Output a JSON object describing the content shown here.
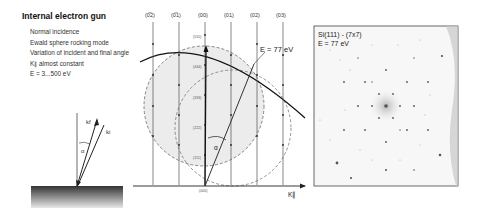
{
  "left_panel": {
    "title": "Internal electron gun",
    "bullets": [
      "Normal incidence",
      "Ewald sphere rocking mode",
      "Variation of incident and final angle",
      "K∥ almost constant",
      "E = 3...500 eV"
    ],
    "schematic": {
      "kf_label": "kf",
      "ki_label": "ki",
      "angle_label": "α"
    }
  },
  "ewald_diagram": {
    "rod_labels": [
      "(0̅2)",
      "(0̅1)",
      "(00)",
      "(01)",
      "(02)",
      "(03)"
    ],
    "spot_labels": [
      "(555)",
      "(444)",
      "(333)",
      "(222)",
      "(111)",
      "(000)"
    ],
    "energy_label": "E = 77 eV",
    "angle_label": "α",
    "axis_label": "K∥"
  },
  "leed_image": {
    "line1": "Si(111) - (7x7)",
    "line2": "E = 77 eV"
  }
}
